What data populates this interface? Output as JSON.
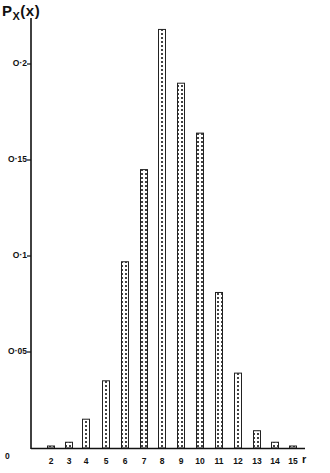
{
  "chart_data": {
    "type": "bar",
    "title": "",
    "xlabel": "r",
    "ylabel": "P_X(x)",
    "categories": [
      "2",
      "3",
      "4",
      "5",
      "6",
      "7",
      "8",
      "9",
      "10",
      "11",
      "12",
      "13",
      "14",
      "15"
    ],
    "values": [
      0.001,
      0.003,
      0.015,
      0.035,
      0.097,
      0.145,
      0.218,
      0.19,
      0.164,
      0.081,
      0.039,
      0.009,
      0.003,
      0.001
    ],
    "yticks": [
      "0",
      "0.05",
      "0.1",
      "0.15",
      "0.2"
    ],
    "ytick_labels": [
      "0",
      "0·05",
      "0·1",
      "0·15",
      "0·2"
    ],
    "ylim": [
      0,
      0.22
    ],
    "grid": false,
    "legend": null,
    "bar_fill": "dotted pattern",
    "colors": {
      "axis": "#111111",
      "bar_outline": "#222222",
      "bar_fill": "#ffffff",
      "dots": "#333333"
    }
  },
  "labels": {
    "y_main": "P",
    "y_sub": "X",
    "y_arg": "(x)",
    "x_axis": "r",
    "origin": "0",
    "caption": "Fig. Probability distribution of r (blurred caption)"
  }
}
